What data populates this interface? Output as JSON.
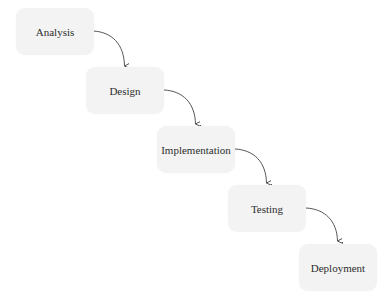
{
  "diagram": {
    "type": "waterfall-process",
    "colors": {
      "background": "#ffffff",
      "box_fill": "#f3f3f3",
      "text": "#2e2e2e",
      "arrow": "#444444"
    },
    "steps": [
      {
        "label": "Analysis"
      },
      {
        "label": "Design"
      },
      {
        "label": "Implementation"
      },
      {
        "label": "Testing"
      },
      {
        "label": "Deployment"
      }
    ],
    "connections": [
      {
        "from": "Analysis",
        "to": "Design"
      },
      {
        "from": "Design",
        "to": "Implementation"
      },
      {
        "from": "Implementation",
        "to": "Testing"
      },
      {
        "from": "Testing",
        "to": "Deployment"
      }
    ]
  }
}
